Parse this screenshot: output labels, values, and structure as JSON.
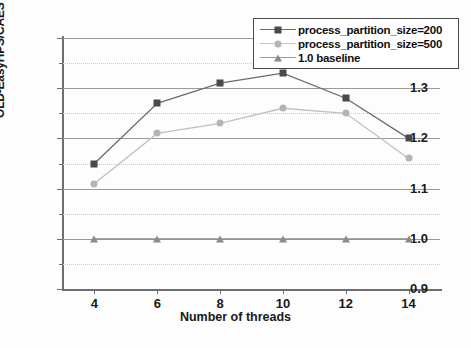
{
  "chart_data": {
    "type": "line",
    "title": "",
    "xlabel": "Number of threads",
    "ylabel": "OLD-EasyHPS/CAEST",
    "x": [
      4,
      6,
      8,
      10,
      12,
      14
    ],
    "xtick_labels": [
      "4",
      "6",
      "8",
      "10",
      "12",
      "14"
    ],
    "ytick_labels": [
      "0.9",
      "1.0",
      "1.1",
      "1.2",
      "1.3",
      "1.4"
    ],
    "ytick_values": [
      0.9,
      1.0,
      1.1,
      1.2,
      1.3,
      1.4
    ],
    "xlim": [
      3,
      15
    ],
    "ylim": [
      0.9,
      1.4
    ],
    "grid": true,
    "legend_position": "top-right",
    "series": [
      {
        "name": "process_partition_size=200",
        "marker": "square",
        "color": "#4a4a4a",
        "line_color": "#6b6b6b",
        "values": [
          1.15,
          1.27,
          1.31,
          1.33,
          1.28,
          1.2
        ]
      },
      {
        "name": "process_partition_size=500",
        "marker": "circle",
        "color": "#b4b4b4",
        "line_color": "#c0c0c0",
        "values": [
          1.11,
          1.21,
          1.23,
          1.26,
          1.25,
          1.16
        ]
      },
      {
        "name": "1.0 baseline",
        "marker": "triangle",
        "color": "#8a8a8a",
        "line_color": "#8a8a8a",
        "values": [
          1.0,
          1.0,
          1.0,
          1.0,
          1.0,
          1.0
        ]
      }
    ]
  },
  "legend": {
    "items": [
      {
        "label": "process_partition_size=200"
      },
      {
        "label": "process_partition_size=500"
      },
      {
        "label": "1.0 baseline"
      }
    ]
  },
  "axes": {
    "x_title": "Number of threads",
    "y_title": "OLD-EasyHPS/CAEST"
  }
}
